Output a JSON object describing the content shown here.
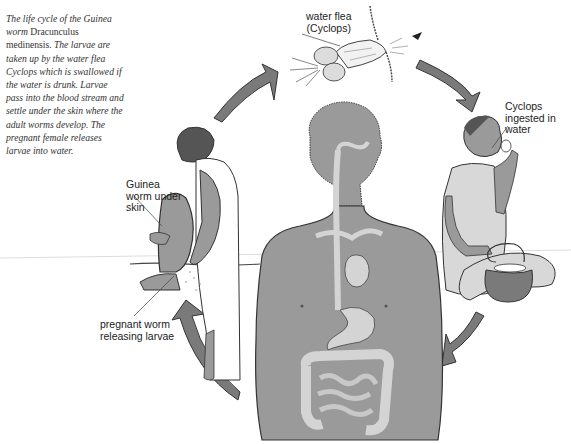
{
  "caption": {
    "part1": "The life cycle of the Guinea worm ",
    "species": "Dracunculus medinensis.",
    "part2": " The larvae are taken up by the water flea Cyclops which is swallowed if the water is drunk. Larvae pass into the blood stream and settle under the skin where the adult worms develop. The pregnant female releases larvae into water."
  },
  "labels": {
    "water_flea": "water flea\n(Cyclops)",
    "cyclops_ingested": "Cyclops\ningested in\nwater",
    "guinea_worm": "Guinea\nworm under\nskin",
    "pregnant_worm": "pregnant worm\nreleasing larvae"
  },
  "figures": {
    "center": "human-torso-with-digestive-tract",
    "left": "person-washing-leg-in-water",
    "right": "person-drinking-from-cup-with-pot",
    "top": "water-flea-cyclops"
  },
  "colors": {
    "figure_gray": "#9a9a9a",
    "arrow_gray": "#7a7a7a",
    "organ_light": "#d4d4d4",
    "outline": "#333333",
    "text": "#222222"
  },
  "cycle_arrows": [
    "left-figure-to-water-flea",
    "water-flea-to-drinking-figure",
    "drinking-figure-to-center-body",
    "center-body-to-left-figure"
  ]
}
